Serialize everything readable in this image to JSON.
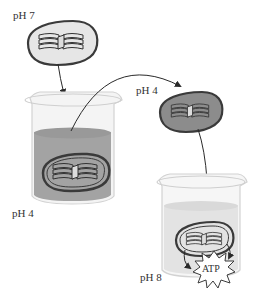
{
  "diagram": {
    "type": "experiment-flow",
    "labels": {
      "start_ph": "pH 7",
      "acid_bath_ph": "pH 4",
      "transferred_ph": "pH 4",
      "base_bath_ph": "pH 8",
      "product": "ATP"
    },
    "steps": [
      {
        "from": "chloroplast-ph7",
        "to": "beaker-ph4"
      },
      {
        "from": "beaker-ph4",
        "to": "chloroplast-ph4"
      },
      {
        "from": "chloroplast-ph4",
        "to": "beaker-ph8"
      },
      {
        "from": "chloroplast-in-ph8",
        "to": "atp-burst"
      }
    ],
    "colors": {
      "stroke": "#3a3a3a",
      "chloroplast_light": "#e6e6e6",
      "chloroplast_dark": "#8c8c8c",
      "acid_solution": "#a3a3a3",
      "base_solution": "#e3e3e3",
      "beaker_glass": "#f4f4f4"
    }
  }
}
